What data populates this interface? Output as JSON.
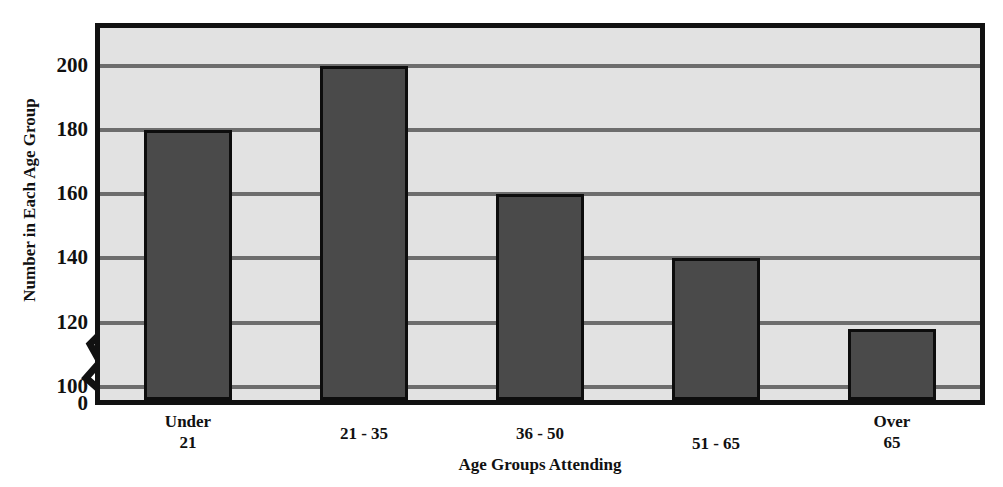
{
  "chart_data": {
    "type": "bar",
    "title": "",
    "xlabel": "Age Groups Attending",
    "ylabel": "Number in Each Age Group",
    "categories": [
      "Under 21",
      "21 - 35",
      "36 - 50",
      "51 - 65",
      "Over 65"
    ],
    "category_labels_multiline": [
      "Under\n21",
      "21 - 35",
      "36 - 50",
      "51 - 65",
      "Over\n65"
    ],
    "values": [
      180,
      200,
      160,
      140,
      118
    ],
    "ylim": [
      0,
      212
    ],
    "y_ticks": [
      0,
      100,
      120,
      140,
      160,
      180,
      200
    ],
    "y_tick_labels": [
      "0",
      "100",
      "120",
      "140",
      "160",
      "180",
      "200"
    ],
    "y_axis_broken": true,
    "y_break_between": [
      0,
      100
    ],
    "grid": true,
    "grid_axis": "y",
    "legend": "none",
    "series": [
      {
        "name": "Number in Each Age Group",
        "values": [
          180,
          200,
          160,
          140,
          118
        ]
      }
    ],
    "colors": {
      "bar_fill": "#4a4a4a",
      "bar_border": "#0d0d0d",
      "plot_background": "#e2e2e2",
      "gridline": "#6d6d6d",
      "frame": "#111111",
      "text": "#111111",
      "page_background": "#ffffff"
    }
  },
  "axes": {
    "y_title": "Number in Each Age Group",
    "x_title": "Age Groups Attending"
  },
  "y_ticks": [
    {
      "label": "200",
      "value": 200
    },
    {
      "label": "180",
      "value": 180
    },
    {
      "label": "160",
      "value": 160
    },
    {
      "label": "140",
      "value": 140
    },
    {
      "label": "120",
      "value": 120
    },
    {
      "label": "100",
      "value": 100
    },
    {
      "label": "0",
      "value": 0
    }
  ],
  "x_ticks": [
    {
      "line1": "Under",
      "line2": "21"
    },
    {
      "line1": "21 - 35",
      "line2": ""
    },
    {
      "line1": "36 - 50",
      "line2": ""
    },
    {
      "line1": "51 - 65",
      "line2": ""
    },
    {
      "line1": "Over",
      "line2": "65"
    }
  ],
  "title_remnant": ""
}
